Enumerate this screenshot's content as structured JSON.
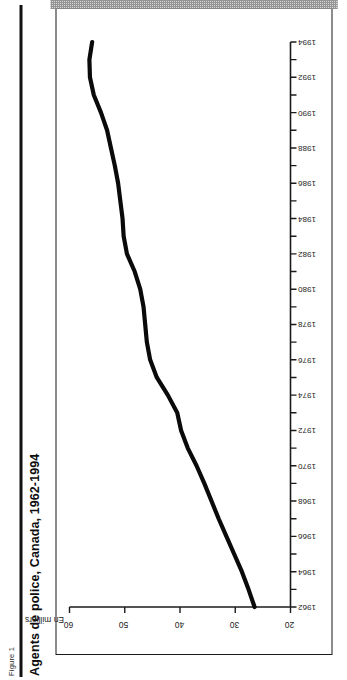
{
  "figure": {
    "label": "Figure 1",
    "title": "Agents de police, Canada, 1962-1994"
  },
  "chart_data": {
    "type": "line",
    "title": "Agents de police, Canada, 1962-1994",
    "xlabel": "",
    "ylabel": "En milliers",
    "ylim": [
      20,
      60
    ],
    "xlim": [
      1962,
      1994
    ],
    "grid": false,
    "legend": null,
    "ytick_labels": [
      "20",
      "30",
      "40",
      "50",
      "60"
    ],
    "ytick_values": [
      20,
      30,
      40,
      50,
      60
    ],
    "xtick_labels": [
      "1962",
      "1964",
      "1966",
      "1968",
      "1970",
      "1972",
      "1974",
      "1976",
      "1978",
      "1980",
      "1982",
      "1984",
      "1986",
      "1988",
      "1990",
      "1992",
      "1994"
    ],
    "xtick_values": [
      1962,
      1964,
      1966,
      1968,
      1970,
      1972,
      1974,
      1976,
      1978,
      1980,
      1982,
      1984,
      1986,
      1988,
      1990,
      1992,
      1994
    ],
    "x": [
      1962,
      1963,
      1964,
      1965,
      1966,
      1967,
      1968,
      1969,
      1970,
      1971,
      1972,
      1973,
      1974,
      1975,
      1976,
      1977,
      1978,
      1979,
      1980,
      1981,
      1982,
      1983,
      1984,
      1985,
      1986,
      1987,
      1988,
      1989,
      1990,
      1991,
      1992,
      1993,
      1994
    ],
    "series": [
      {
        "name": "Agents de police",
        "values": [
          26.5,
          27.6,
          28.8,
          30.2,
          31.6,
          33.0,
          34.3,
          35.6,
          37.0,
          38.6,
          39.8,
          40.5,
          42.2,
          44.2,
          45.4,
          46.0,
          46.3,
          46.6,
          47.2,
          48.2,
          49.6,
          50.2,
          50.4,
          50.8,
          51.2,
          51.8,
          52.5,
          53.2,
          54.3,
          55.6,
          56.3,
          56.4,
          55.9
        ]
      }
    ]
  }
}
